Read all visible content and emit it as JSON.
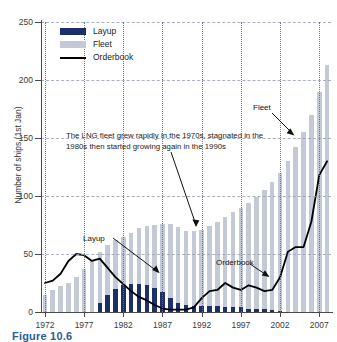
{
  "figure": {
    "caption": "Figure 10.6"
  },
  "chart_data": {
    "type": "bar",
    "title": "",
    "xlabel": "",
    "ylabel": "Number of ships (1st Jan)",
    "ylim": [
      0,
      250
    ],
    "yticks": [
      0,
      50,
      100,
      150,
      200,
      250
    ],
    "xlim": [
      1972,
      2008
    ],
    "xticks": [
      1972,
      1977,
      1982,
      1987,
      1992,
      1997,
      2002,
      2007
    ],
    "grid": "horizontal dashed, vertical dotted at 5-year ticks",
    "legend_position": "upper-left inside axes",
    "x": [
      1972,
      1973,
      1974,
      1975,
      1976,
      1977,
      1978,
      1979,
      1980,
      1981,
      1982,
      1983,
      1984,
      1985,
      1986,
      1987,
      1988,
      1989,
      1990,
      1991,
      1992,
      1993,
      1994,
      1995,
      1996,
      1997,
      1998,
      1999,
      2000,
      2001,
      2002,
      2003,
      2004,
      2005,
      2006,
      2007,
      2008
    ],
    "series": [
      {
        "name": "Fleet",
        "type": "bar",
        "color": "#c3c9d6",
        "values": [
          15,
          19,
          22,
          25,
          30,
          37,
          45,
          52,
          58,
          62,
          65,
          68,
          72,
          74,
          75,
          76,
          76,
          73,
          70,
          70,
          71,
          74,
          78,
          82,
          86,
          90,
          94,
          99,
          105,
          112,
          120,
          130,
          142,
          155,
          170,
          190,
          213
        ]
      },
      {
        "name": "Layup",
        "type": "bar",
        "color": "#1d2f6b",
        "values": [
          0,
          0,
          0,
          0,
          0,
          0,
          0,
          8,
          15,
          20,
          23,
          24,
          24,
          23,
          21,
          17,
          12,
          8,
          6,
          5,
          5,
          5,
          5,
          4,
          4,
          4,
          3,
          3,
          3,
          2,
          1,
          0,
          0,
          0,
          0,
          0,
          0
        ]
      },
      {
        "name": "Orderbook",
        "type": "line",
        "color": "#000000",
        "values": [
          25,
          27,
          33,
          44,
          50,
          49,
          44,
          46,
          38,
          30,
          24,
          18,
          13,
          10,
          6,
          3,
          2,
          2,
          2,
          4,
          12,
          18,
          19,
          25,
          21,
          19,
          23,
          21,
          18,
          19,
          30,
          52,
          56,
          56,
          78,
          118,
          130
        ]
      }
    ],
    "annotations": [
      {
        "name": "narrative-note",
        "text": "The LNG fleet grew rapidly in the 1970s, stagnated in the 1980s then started growing again in the 1990s"
      },
      {
        "name": "layup-callout",
        "text": "Layup"
      },
      {
        "name": "fleet-callout",
        "text": "Fleet"
      },
      {
        "name": "orderbook-callout",
        "text": "Orderbook"
      }
    ]
  },
  "legend": {
    "items": [
      {
        "label": "Layup",
        "swatch": "layup"
      },
      {
        "label": "Fleet",
        "swatch": "fleet"
      },
      {
        "label": "Orderbook",
        "swatch": "line"
      }
    ]
  }
}
